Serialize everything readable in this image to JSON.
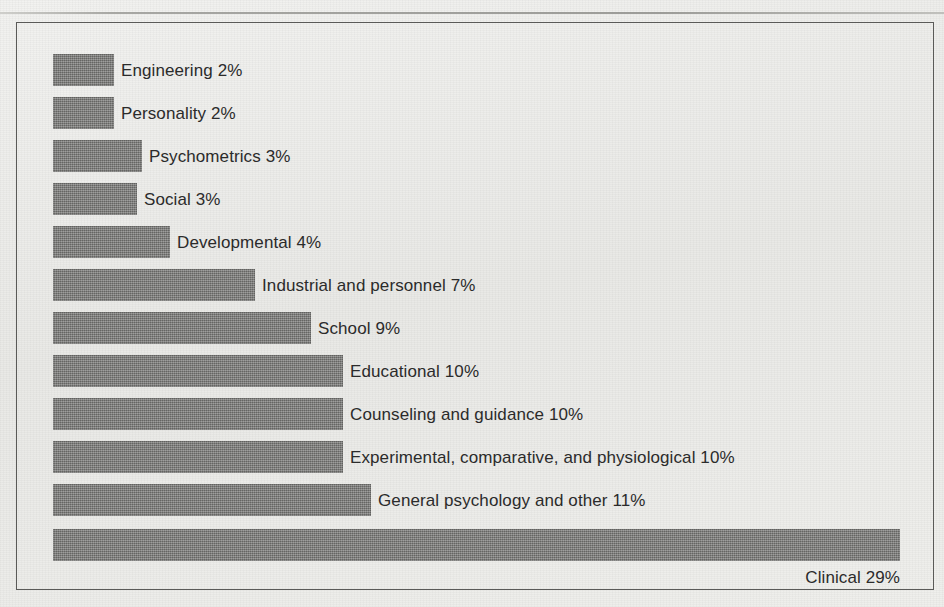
{
  "chart_data": {
    "type": "bar",
    "orientation": "horizontal",
    "title": "",
    "subtitle": "",
    "xlabel": "",
    "ylabel": "",
    "grid": false,
    "legend": "none",
    "axis_visible": false,
    "xlim": [
      0,
      29
    ],
    "value_suffix": "%",
    "categories": [
      "Engineering",
      "Personality",
      "Psychometrics",
      "Social",
      "Developmental",
      "Industrial and personnel",
      "School",
      "Educational",
      "Counseling and guidance",
      "Experimental, comparative, and physiological",
      "General psychology and other",
      "Clinical"
    ],
    "values": [
      2,
      2,
      3,
      3,
      4,
      7,
      9,
      10,
      10,
      10,
      11,
      29
    ],
    "data_labels": [
      "Engineering 2%",
      "Personality 2%",
      "Psychometrics 3%",
      "Social 3%",
      "Developmental 4%",
      "Industrial and personnel 7%",
      "School 9%",
      "Educational 10%",
      "Counseling and guidance 10%",
      "Experimental, comparative, and physiological 10%",
      "General psychology and other 11%",
      "Clinical 29%"
    ],
    "bar_color": "#7b7b79",
    "background_color": "#eeeeec",
    "frame_color": "#5a5a58",
    "text_color": "#2b2b2b"
  },
  "chart": {
    "bars": [
      {
        "label": "Engineering 2%",
        "value": 2,
        "width_px": 61,
        "top_px": 54,
        "label_below": false
      },
      {
        "label": "Personality 2%",
        "value": 2,
        "width_px": 61,
        "top_px": 97,
        "label_below": false
      },
      {
        "label": "Psychometrics 3%",
        "value": 3,
        "width_px": 89,
        "top_px": 140,
        "label_below": false
      },
      {
        "label": "Social 3%",
        "value": 3,
        "width_px": 84,
        "top_px": 183,
        "label_below": false
      },
      {
        "label": "Developmental 4%",
        "value": 4,
        "width_px": 117,
        "top_px": 226,
        "label_below": false
      },
      {
        "label": "Industrial and personnel 7%",
        "value": 7,
        "width_px": 202,
        "top_px": 269,
        "label_below": false
      },
      {
        "label": "School 9%",
        "value": 9,
        "width_px": 258,
        "top_px": 312,
        "label_below": false
      },
      {
        "label": "Educational 10%",
        "value": 10,
        "width_px": 290,
        "top_px": 355,
        "label_below": false
      },
      {
        "label": "Counseling and guidance 10%",
        "value": 10,
        "width_px": 290,
        "top_px": 398,
        "label_below": false
      },
      {
        "label": "Experimental, comparative, and physiological 10%",
        "value": 10,
        "width_px": 290,
        "top_px": 441,
        "label_below": false
      },
      {
        "label": "General psychology and other 11%",
        "value": 11,
        "width_px": 318,
        "top_px": 484,
        "label_below": false
      },
      {
        "label": "Clinical 29%",
        "value": 29,
        "width_px": 847,
        "top_px": 529,
        "label_below": true
      }
    ]
  }
}
